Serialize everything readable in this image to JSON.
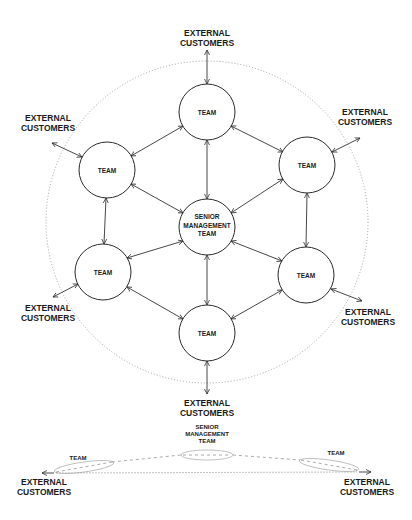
{
  "diagram": {
    "type": "network-hub",
    "colors": {
      "stroke": "#333333",
      "ring": "#9a9a9a",
      "background": "#ffffff"
    },
    "center_node": {
      "line1": "SENIOR",
      "line2": "MANAGEMENT",
      "line3": "TEAM"
    },
    "team_nodes": [
      {
        "id": "top",
        "label": "TEAM"
      },
      {
        "id": "upper-left",
        "label": "TEAM"
      },
      {
        "id": "upper-right",
        "label": "TEAM"
      },
      {
        "id": "lower-left",
        "label": "TEAM"
      },
      {
        "id": "lower-right",
        "label": "TEAM"
      },
      {
        "id": "bottom",
        "label": "TEAM"
      }
    ],
    "external": [
      {
        "id": "top",
        "line1": "EXTERNAL",
        "line2": "CUSTOMERS"
      },
      {
        "id": "upper-left",
        "line1": "EXTERNAL",
        "line2": "CUSTOMERS"
      },
      {
        "id": "upper-right",
        "line1": "EXTERNAL",
        "line2": "CUSTOMERS"
      },
      {
        "id": "lower-left",
        "line1": "EXTERNAL",
        "line2": "CUSTOMERS"
      },
      {
        "id": "lower-right",
        "line1": "EXTERNAL",
        "line2": "CUSTOMERS"
      },
      {
        "id": "bottom",
        "line1": "EXTERNAL",
        "line2": "CUSTOMERS"
      }
    ]
  },
  "side_view": {
    "center": {
      "line1": "SENIOR",
      "line2": "MANAGEMENT",
      "line3": "TEAM"
    },
    "left_team": "TEAM",
    "right_team": "TEAM",
    "left_external": {
      "line1": "EXTERNAL",
      "line2": "CUSTOMERS"
    },
    "right_external": {
      "line1": "EXTERNAL",
      "line2": "CUSTOMERS"
    }
  }
}
